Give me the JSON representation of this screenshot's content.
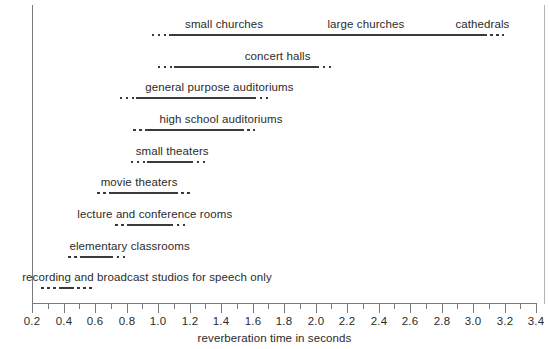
{
  "chart_data": {
    "type": "bar",
    "title": "",
    "xlabel": "reverberation time in seconds",
    "ylabel": "",
    "xlim": [
      0.2,
      3.4
    ],
    "grid": false,
    "legend": null,
    "orientation": "horizontal-range",
    "tick_labels": [
      "0.2",
      "0.4",
      "0.6",
      "0.8",
      "1.0",
      "1.2",
      "1.4",
      "1.6",
      "1.8",
      "2.0",
      "2.2",
      "2.4",
      "2.6",
      "2.8",
      "3.0",
      "3.2",
      "3.4"
    ],
    "tick_values": [
      0.2,
      0.4,
      0.6,
      0.8,
      1.0,
      1.2,
      1.4,
      1.6,
      1.8,
      2.0,
      2.2,
      2.4,
      2.6,
      2.8,
      3.0,
      3.2,
      3.4
    ],
    "minor_tick_values": [
      0.3,
      0.5,
      0.7,
      0.9,
      1.1,
      1.3,
      1.5,
      1.7,
      1.9,
      2.1,
      2.3,
      2.5,
      2.7,
      2.9,
      3.1,
      3.3
    ],
    "line_color": "#3a3a3a",
    "axis_color": "#7a7a7a",
    "categories": [
      {
        "name": "small churches",
        "labels": [
          {
            "text": "small churches",
            "center": 1.42
          },
          {
            "text": "large churches",
            "center": 2.32
          },
          {
            "text": "cathedrals",
            "center": 3.06
          }
        ],
        "dot_start": 0.96,
        "solid_start": 1.07,
        "solid_end": 3.07,
        "dot_end": 3.2
      },
      {
        "name": "concert halls",
        "labels": [
          {
            "text": "concert halls",
            "center": 1.76
          }
        ],
        "dot_start": 1.0,
        "solid_start": 1.1,
        "solid_end": 2.01,
        "dot_end": 2.1
      },
      {
        "name": "general purpose auditoriums",
        "labels": [
          {
            "text": "general purpose auditoriums",
            "center": 1.39
          }
        ],
        "dot_start": 0.76,
        "solid_start": 0.86,
        "solid_end": 1.61,
        "dot_end": 1.7
      },
      {
        "name": "high school auditoriums",
        "labels": [
          {
            "text": "high school auditoriums",
            "center": 1.4
          }
        ],
        "dot_start": 0.84,
        "solid_start": 0.93,
        "solid_end": 1.53,
        "dot_end": 1.64
      },
      {
        "name": "small theaters",
        "labels": [
          {
            "text": "small theaters",
            "center": 1.09
          }
        ],
        "dot_start": 0.83,
        "solid_start": 0.93,
        "solid_end": 1.21,
        "dot_end": 1.32
      },
      {
        "name": "movie theaters",
        "labels": [
          {
            "text": "movie theaters",
            "center": 0.88
          }
        ],
        "dot_start": 0.61,
        "solid_start": 0.7,
        "solid_end": 1.11,
        "dot_end": 1.21
      },
      {
        "name": "lecture and conference rooms",
        "labels": [
          {
            "text": "lecture and conference rooms",
            "center": 0.98
          }
        ],
        "dot_start": 0.73,
        "solid_start": 0.82,
        "solid_end": 1.08,
        "dot_end": 1.19
      },
      {
        "name": "elementary classrooms",
        "labels": [
          {
            "text": "elementary classrooms",
            "center": 0.82
          }
        ],
        "dot_start": 0.43,
        "solid_start": 0.52,
        "solid_end": 0.7,
        "dot_end": 0.81
      },
      {
        "name": "recording and broadcast studios for speech only",
        "labels": [
          {
            "text": "recording and broadcast studios for speech only",
            "center": 0.93
          }
        ],
        "dot_start": 0.26,
        "solid_start": 0.39,
        "solid_end": 0.45,
        "dot_end": 0.58
      }
    ]
  }
}
